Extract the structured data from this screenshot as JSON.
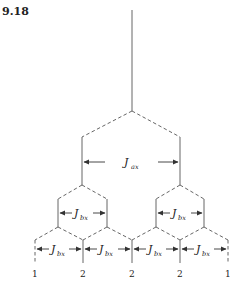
{
  "figure": {
    "number": "9.18"
  },
  "labels": {
    "top_coupling": {
      "main": "J",
      "sub": "ax"
    },
    "left_hex_coupling": {
      "main": "J",
      "sub": "bx"
    },
    "right_hex_coupling": {
      "main": "J",
      "sub": "bx"
    },
    "bottom_couplings": [
      {
        "main": "J",
        "sub": "bx"
      },
      {
        "main": "J",
        "sub": "bx"
      },
      {
        "main": "J",
        "sub": "bx"
      },
      {
        "main": "J",
        "sub": "bx"
      }
    ]
  },
  "intensity_ratios": [
    "1",
    "2",
    "2",
    "2",
    "1"
  ]
}
